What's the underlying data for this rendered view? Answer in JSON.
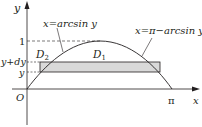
{
  "diagram": {
    "axes": {
      "y_label": "y",
      "x_label": "x",
      "origin_label": "O",
      "pi_label": "π"
    },
    "y_ticks": {
      "one": "1",
      "y_plus_dy": "y+dy",
      "y": "y"
    },
    "regions": {
      "d2": "D",
      "d2_sub": "2",
      "d1": "D",
      "d1_sub": "1"
    },
    "curves": {
      "left": "x=arcsin y",
      "right": "x=π−arcsin y"
    },
    "colors": {
      "line": "#231f20",
      "strip_fill": "#d9d9d9",
      "background": "#ffffff"
    }
  }
}
